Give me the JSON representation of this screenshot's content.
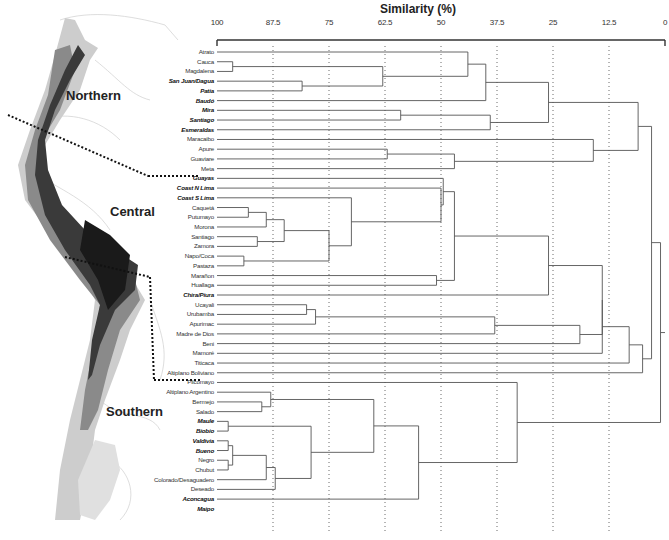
{
  "axis": {
    "title": "Similarity (%)",
    "ticks": [
      "100",
      "87.5",
      "75",
      "62.5",
      "50",
      "37.5",
      "25",
      "12.5",
      "0"
    ]
  },
  "regions": {
    "northern": "Northern",
    "central": "Central",
    "southern": "Southern"
  },
  "leaves": [
    {
      "label": "Atrato",
      "bold": false
    },
    {
      "label": "Cauca",
      "bold": false
    },
    {
      "label": "Magdalena",
      "bold": false
    },
    {
      "label": "San Juan/Dagua",
      "bold": true
    },
    {
      "label": "Patia",
      "bold": true
    },
    {
      "label": "Baudó",
      "bold": true
    },
    {
      "label": "Mira",
      "bold": true
    },
    {
      "label": "Santiago",
      "bold": true
    },
    {
      "label": "Esmeraldas",
      "bold": true
    },
    {
      "label": "Maracaibo",
      "bold": false
    },
    {
      "label": "Apure",
      "bold": false
    },
    {
      "label": "Guaviare",
      "bold": false
    },
    {
      "label": "Meta",
      "bold": false
    },
    {
      "label": "Guayas",
      "bold": true
    },
    {
      "label": "Coast N Lima",
      "bold": true
    },
    {
      "label": "Coast S Lima",
      "bold": true
    },
    {
      "label": "Caquetá",
      "bold": false
    },
    {
      "label": "Putumayo",
      "bold": false
    },
    {
      "label": "Morona",
      "bold": false
    },
    {
      "label": "Santiago",
      "bold": false
    },
    {
      "label": "Zamora",
      "bold": false
    },
    {
      "label": "Napo/Coca",
      "bold": false
    },
    {
      "label": "Pastaza",
      "bold": false
    },
    {
      "label": "Marañon",
      "bold": false
    },
    {
      "label": "Huallaga",
      "bold": false
    },
    {
      "label": "Chira/Piura",
      "bold": true
    },
    {
      "label": "Ucayali",
      "bold": false
    },
    {
      "label": "Urubamba",
      "bold": false
    },
    {
      "label": "Apurimac",
      "bold": false
    },
    {
      "label": "Madre de Dios",
      "bold": false
    },
    {
      "label": "Beni",
      "bold": false
    },
    {
      "label": "Mamoré",
      "bold": false
    },
    {
      "label": "Titicaca",
      "bold": false
    },
    {
      "label": "Altiplano Boliviano",
      "bold": false
    },
    {
      "label": "Pilcomayo",
      "bold": false
    },
    {
      "label": "Altiplano Argentino",
      "bold": false
    },
    {
      "label": "Bermejo",
      "bold": false
    },
    {
      "label": "Salado",
      "bold": false
    },
    {
      "label": "Maule",
      "bold": true
    },
    {
      "label": "Biobio",
      "bold": true
    },
    {
      "label": "Valdivia",
      "bold": true
    },
    {
      "label": "Bueno",
      "bold": true
    },
    {
      "label": "Negro",
      "bold": false
    },
    {
      "label": "Chubut",
      "bold": false
    },
    {
      "label": "Colorado/Desaguadero",
      "bold": false
    },
    {
      "label": "Deseado",
      "bold": false
    },
    {
      "label": "Aconcagua",
      "bold": true
    },
    {
      "label": "Maipo",
      "bold": true
    }
  ],
  "merges": [
    {
      "a": "L1",
      "b": "L2",
      "s": 96.5,
      "id": "m1"
    },
    {
      "a": "L3",
      "b": "L4",
      "s": 81,
      "id": "m2"
    },
    {
      "a": "m1",
      "b": "m2",
      "s": 63,
      "id": "m3"
    },
    {
      "a": "L0",
      "b": "m3",
      "s": 44,
      "id": "m4"
    },
    {
      "a": "m4",
      "b": "L5",
      "s": 40,
      "id": "m5"
    },
    {
      "a": "L6",
      "b": "L7",
      "s": 59,
      "id": "m6"
    },
    {
      "a": "m6",
      "b": "L8",
      "s": 39,
      "id": "m7"
    },
    {
      "a": "m5",
      "b": "m7",
      "s": 26,
      "id": "m8"
    },
    {
      "a": "L10",
      "b": "L11",
      "s": 62,
      "id": "m9"
    },
    {
      "a": "m9",
      "b": "L12",
      "s": 47,
      "id": "m10"
    },
    {
      "a": "L9",
      "b": "m10",
      "s": 16,
      "id": "m11"
    },
    {
      "a": "m8",
      "b": "m11",
      "s": 6,
      "id": "m12"
    },
    {
      "a": "L16",
      "b": "L17",
      "s": 93,
      "id": "m13"
    },
    {
      "a": "m13",
      "b": "L18",
      "s": 89,
      "id": "m14"
    },
    {
      "a": "L19",
      "b": "L20",
      "s": 91,
      "id": "m15"
    },
    {
      "a": "m14",
      "b": "m15",
      "s": 85,
      "id": "m16"
    },
    {
      "a": "L21",
      "b": "L22",
      "s": 94,
      "id": "m17"
    },
    {
      "a": "m16",
      "b": "m17",
      "s": 75,
      "id": "m18"
    },
    {
      "a": "L15",
      "b": "m18",
      "s": 70,
      "id": "m19"
    },
    {
      "a": "L14",
      "b": "m19",
      "s": 50,
      "id": "m20"
    },
    {
      "a": "L13",
      "b": "m20",
      "s": 49.5,
      "id": "m21"
    },
    {
      "a": "L23",
      "b": "L24",
      "s": 51,
      "id": "m22"
    },
    {
      "a": "m21",
      "b": "m22",
      "s": 47,
      "id": "m23"
    },
    {
      "a": "m23",
      "b": "L25",
      "s": 26,
      "id": "m24"
    },
    {
      "a": "L26",
      "b": "L27",
      "s": 80,
      "id": "m25"
    },
    {
      "a": "m25",
      "b": "L28",
      "s": 78,
      "id": "m26"
    },
    {
      "a": "m26",
      "b": "L29",
      "s": 38,
      "id": "m27"
    },
    {
      "a": "m27",
      "b": "L30",
      "s": 19,
      "id": "m28"
    },
    {
      "a": "m24",
      "b": "m28",
      "s": 14,
      "id": "m29"
    },
    {
      "a": "m29",
      "b": "L31",
      "s": 14,
      "id": "m30"
    },
    {
      "a": "m30",
      "b": "L32",
      "s": 8,
      "id": "m31"
    },
    {
      "a": "m31",
      "b": "L33",
      "s": 5,
      "id": "m32"
    },
    {
      "a": "m12",
      "b": "m32",
      "s": 3,
      "id": "m33"
    },
    {
      "a": "L36",
      "b": "L37",
      "s": 90,
      "id": "m34"
    },
    {
      "a": "L35",
      "b": "m34",
      "s": 88,
      "id": "m35"
    },
    {
      "a": "L38",
      "b": "L39",
      "s": 97.5,
      "id": "m36"
    },
    {
      "a": "L40",
      "b": "L41",
      "s": 97.5,
      "id": "m37"
    },
    {
      "a": "L42",
      "b": "L43",
      "s": 97.5,
      "id": "m38"
    },
    {
      "a": "m37",
      "b": "m38",
      "s": 96.5,
      "id": "m39"
    },
    {
      "a": "m39",
      "b": "L44",
      "s": 89,
      "id": "m40"
    },
    {
      "a": "m40",
      "b": "L45",
      "s": 87,
      "id": "m41"
    },
    {
      "a": "m36",
      "b": "m41",
      "s": 79,
      "id": "m42"
    },
    {
      "a": "m35",
      "b": "m42",
      "s": 65,
      "id": "m43"
    },
    {
      "a": "m43",
      "b": "L46",
      "s": 55,
      "id": "m44"
    },
    {
      "a": "L34",
      "b": "m44",
      "s": 33,
      "id": "m45"
    },
    {
      "a": "m33",
      "b": "m45",
      "s": 1,
      "id": "m46"
    }
  ],
  "colors": {
    "line": "#555555",
    "grid": "#444444",
    "map_land": "#c8c8c8",
    "map_mountain": "#333333"
  },
  "chart_data": {
    "type": "dendrogram",
    "title": "Similarity (%)",
    "xlabel": "Similarity (%)",
    "xlim": [
      100,
      0
    ],
    "tick_labels": [
      "100",
      "87.5",
      "75",
      "62.5",
      "50",
      "37.5",
      "25",
      "12.5",
      "0"
    ],
    "groups": {
      "Northern": [
        "Atrato",
        "Cauca",
        "Magdalena",
        "San Juan/Dagua",
        "Patia",
        "Baudó",
        "Mira",
        "Santiago",
        "Esmeraldas",
        "Maracaibo",
        "Apure",
        "Guaviare",
        "Meta"
      ],
      "Central": [
        "Guayas",
        "Coast N Lima",
        "Coast S Lima",
        "Caquetá",
        "Putumayo",
        "Morona",
        "Santiago",
        "Zamora",
        "Napo/Coca",
        "Pastaza",
        "Marañon",
        "Huallaga",
        "Chira/Piura",
        "Ucayali",
        "Urubamba",
        "Apurimac",
        "Madre de Dios",
        "Beni",
        "Mamoré",
        "Titicaca",
        "Altiplano Boliviano"
      ],
      "Southern": [
        "Pilcomayo",
        "Altiplano Argentino",
        "Bermejo",
        "Salado",
        "Maule",
        "Biobio",
        "Valdivia",
        "Bueno",
        "Negro",
        "Chubut",
        "Colorado/Desaguadero",
        "Deseado",
        "Aconcagua",
        "Maipo"
      ]
    },
    "grid": "dotted vertical at each tick"
  }
}
